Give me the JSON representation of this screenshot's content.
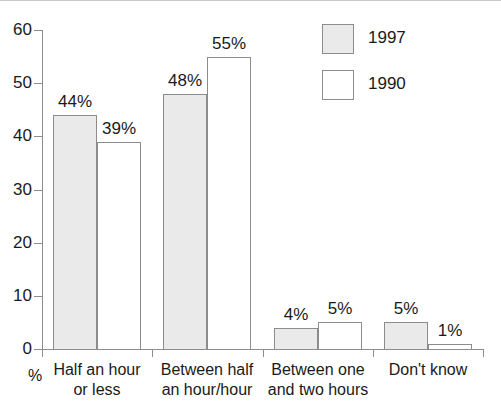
{
  "chart_data": {
    "type": "bar",
    "title": "",
    "subtitle": "",
    "xlabel": "",
    "ylabel": "%",
    "ylim": [
      0,
      60
    ],
    "yticks": [
      0,
      10,
      20,
      30,
      40,
      50,
      60
    ],
    "ytick_labels": [
      "0",
      "10",
      "20",
      "30",
      "40",
      "50",
      "60"
    ],
    "grid": false,
    "legend_position": "top-right",
    "categories": [
      "Half an hour\nor less",
      "Between half\nan hour/hour",
      "Between one\nand two hours",
      "Don't know"
    ],
    "category_lines": [
      [
        "Half an hour",
        "or less"
      ],
      [
        "Between half",
        "an hour/hour"
      ],
      [
        "Between one",
        "and two hours"
      ],
      [
        "Don't know"
      ]
    ],
    "series": [
      {
        "name": "1997",
        "color": "#eaeaea",
        "border_color": "#8c8c8c",
        "values": [
          44,
          48,
          4,
          5
        ],
        "data_labels": [
          "44%",
          "48%",
          "4%",
          "5%"
        ]
      },
      {
        "name": "1990",
        "color": "#ffffff",
        "border_color": "#8c8c8c",
        "values": [
          39,
          55,
          5,
          1
        ],
        "data_labels": [
          "39%",
          "55%",
          "5%",
          "1%"
        ]
      }
    ]
  },
  "legend": {
    "items": [
      {
        "label": "1997",
        "swatch": "legend-swatch-1997"
      },
      {
        "label": "1990",
        "swatch": "legend-swatch-1990"
      }
    ]
  },
  "axes": {
    "unit_label": "%"
  }
}
